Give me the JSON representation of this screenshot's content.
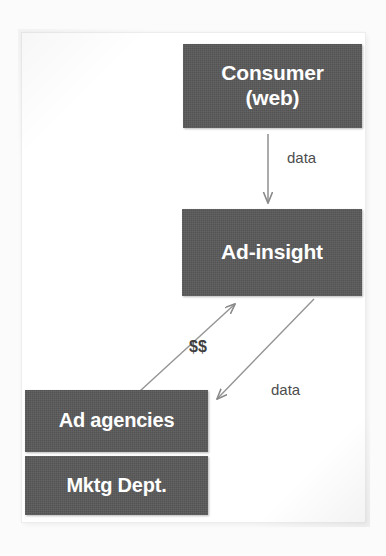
{
  "diagram": {
    "background_color": "#ffffff",
    "node_fill_color": "#595959",
    "node_text_color": "#ffffff",
    "arrow_color": "#808080",
    "label_text_color": "#4d4d4d",
    "nodes": [
      {
        "id": "consumer",
        "label_line1": "Consumer",
        "label_line2": "(web)"
      },
      {
        "id": "adinsight",
        "label": "Ad-insight"
      },
      {
        "id": "adagencies",
        "label": "Ad agencies"
      },
      {
        "id": "mktgdept",
        "label": "Mktg Dept."
      }
    ],
    "edges": [
      {
        "id": "consumer-to-adinsight",
        "label": "data",
        "from": "consumer",
        "to": "adinsight",
        "direction": "down"
      },
      {
        "id": "adagencies-to-adinsight",
        "label": "$$",
        "from": "adagencies",
        "to": "adinsight",
        "direction": "up-right"
      },
      {
        "id": "adinsight-to-adagencies",
        "label": "data",
        "from": "adinsight",
        "to": "adagencies",
        "direction": "down-left"
      }
    ]
  }
}
